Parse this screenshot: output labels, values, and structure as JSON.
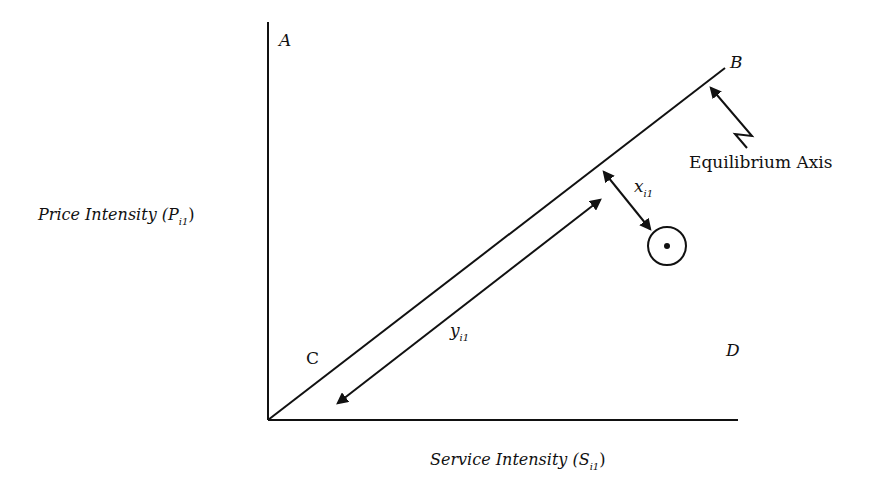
{
  "diagram": {
    "y_axis_label": {
      "text": "Price Intensity (P",
      "sub": "i1",
      "close": ")"
    },
    "x_axis_label": {
      "text": "Service Intensity (S",
      "sub": "i1",
      "close": ")"
    },
    "region_labels": {
      "A": "A",
      "B": "B",
      "C": "C",
      "D": "D"
    },
    "equilibrium_label": "Equilibrium Axis",
    "x_label": {
      "text": "x",
      "sub": "i1"
    },
    "y_label": {
      "text": "y",
      "sub": "i1"
    },
    "colors": {
      "ink": "#111111",
      "background": "#ffffff"
    }
  }
}
